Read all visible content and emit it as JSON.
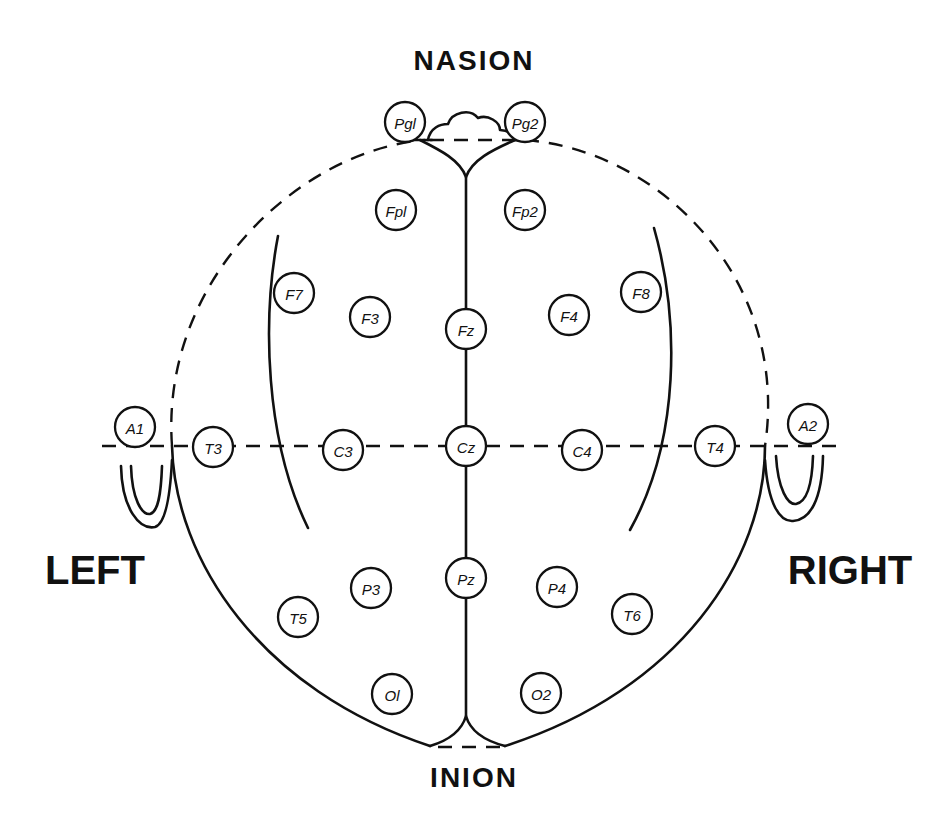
{
  "diagram": {
    "title_top": "NASION",
    "title_bottom": "INION",
    "title_left": "LEFT",
    "title_right": "RIGHT",
    "electrodes": [
      {
        "id": "Pg1",
        "label": "Pgl",
        "x": 405,
        "y": 122
      },
      {
        "id": "Pg2",
        "label": "Pg2",
        "x": 525,
        "y": 122
      },
      {
        "id": "Fp1",
        "label": "Fpl",
        "x": 396,
        "y": 210
      },
      {
        "id": "Fp2",
        "label": "Fp2",
        "x": 525,
        "y": 210
      },
      {
        "id": "F7",
        "label": "F7",
        "x": 294,
        "y": 293
      },
      {
        "id": "F3",
        "label": "F3",
        "x": 370,
        "y": 317
      },
      {
        "id": "Fz",
        "label": "Fz",
        "x": 466,
        "y": 329
      },
      {
        "id": "F4",
        "label": "F4",
        "x": 569,
        "y": 315
      },
      {
        "id": "F8",
        "label": "F8",
        "x": 641,
        "y": 292
      },
      {
        "id": "A1",
        "label": "A1",
        "x": 135,
        "y": 427
      },
      {
        "id": "T3",
        "label": "T3",
        "x": 213,
        "y": 447
      },
      {
        "id": "C3",
        "label": "C3",
        "x": 343,
        "y": 450
      },
      {
        "id": "Cz",
        "label": "Cz",
        "x": 466,
        "y": 446
      },
      {
        "id": "C4",
        "label": "C4",
        "x": 582,
        "y": 450
      },
      {
        "id": "T4",
        "label": "T4",
        "x": 715,
        "y": 446
      },
      {
        "id": "A2",
        "label": "A2",
        "x": 808,
        "y": 424
      },
      {
        "id": "P3",
        "label": "P3",
        "x": 371,
        "y": 588
      },
      {
        "id": "Pz",
        "label": "Pz",
        "x": 466,
        "y": 578
      },
      {
        "id": "P4",
        "label": "P4",
        "x": 557,
        "y": 587
      },
      {
        "id": "T5",
        "label": "T5",
        "x": 298,
        "y": 617
      },
      {
        "id": "T6",
        "label": "T6",
        "x": 632,
        "y": 614
      },
      {
        "id": "O1",
        "label": "Ol",
        "x": 392,
        "y": 694
      },
      {
        "id": "O2",
        "label": "O2",
        "x": 541,
        "y": 693
      }
    ],
    "colors": {
      "ink": "#111111",
      "background": "#ffffff"
    }
  }
}
